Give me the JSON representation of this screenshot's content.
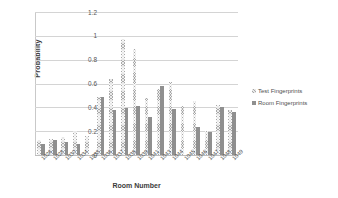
{
  "chart_data": {
    "type": "bar",
    "title": "",
    "xlabel": "Room Number",
    "ylabel": "Probability",
    "ylim": [
      0,
      1.2
    ],
    "yticks": [
      "0",
      "0.2",
      "0.4",
      "0.6",
      "0.8",
      "1",
      "1.2"
    ],
    "ytick_values": [
      0,
      0.2,
      0.4,
      0.6,
      0.8,
      1,
      1.2
    ],
    "grid": true,
    "legend_position": "right",
    "categories": [
      "1026",
      "1028",
      "1030",
      "1034",
      "1035",
      "1036",
      "1037",
      "1038",
      "1039",
      "1041",
      "1043",
      "1044",
      "1045",
      "1046",
      "1047",
      "1048",
      "1049"
    ],
    "series": [
      {
        "name": "Test Fingerprints",
        "color": "#a8a8a8",
        "values": [
          0.13,
          0.135,
          0.155,
          0.205,
          0.16,
          0.485,
          0.64,
          0.97,
          0.89,
          0.48,
          0.555,
          0.61,
          0.415,
          0.455,
          0.205,
          0.42,
          0.375
        ]
      },
      {
        "name": "Room Fingerprints",
        "color": "#8f8f8f",
        "values": [
          0.095,
          0.13,
          0.11,
          0.095,
          0.0,
          0.49,
          0.375,
          0.395,
          0.415,
          0.32,
          0.575,
          0.39,
          0.0,
          0.235,
          0.195,
          0.4,
          0.365
        ]
      }
    ]
  },
  "legend": {
    "items": [
      {
        "label": "Test Fingerprints"
      },
      {
        "label": "Room Fingerprints"
      }
    ]
  }
}
